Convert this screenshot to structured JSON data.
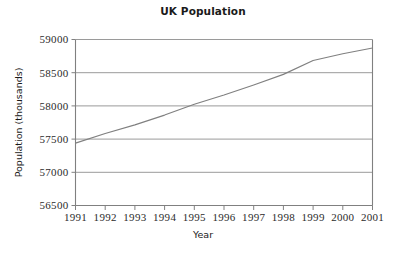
{
  "chart_data": {
    "type": "line",
    "title": "UK Population",
    "xlabel": "Year",
    "ylabel": "Population (thousands)",
    "xlim": [
      1991,
      2001
    ],
    "ylim": [
      56500,
      59000
    ],
    "grid": true,
    "legend": null,
    "x_ticks": [
      "1991",
      "1992",
      "1993",
      "1994",
      "1995",
      "1996",
      "1997",
      "1998",
      "1999",
      "2000",
      "2001"
    ],
    "y_ticks": [
      "56500",
      "57000",
      "57500",
      "58000",
      "58500",
      "59000"
    ],
    "series": [
      {
        "name": "UK Population",
        "color": "#808080",
        "x": [
          1991,
          1992,
          1993,
          1994,
          1995,
          1996,
          1997,
          1998,
          1999,
          2000,
          2001
        ],
        "values": [
          57439,
          57585,
          57714,
          57862,
          58025,
          58164,
          58314,
          58475,
          58684,
          58785,
          58872
        ]
      }
    ]
  },
  "axes": {
    "line_color": "#808080",
    "grid_color": "#9a9a9a",
    "text_color": "#2b2b2b"
  }
}
